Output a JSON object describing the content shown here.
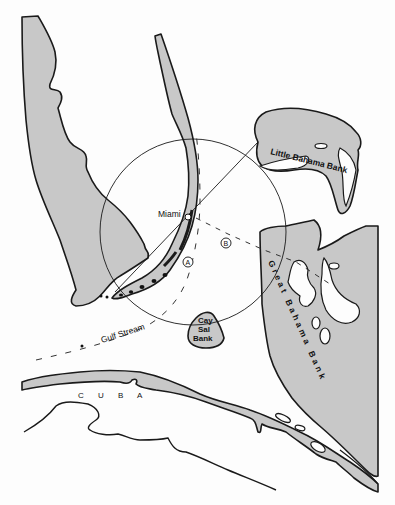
{
  "map": {
    "title": "",
    "colors": {
      "land": "#c8c8c8",
      "outline": "#1a1a1a",
      "background": "#fdfdfd"
    },
    "labels": {
      "miami": "Miami",
      "little_bahama_bank": "Little Bahama Bank",
      "great_bahama_bank": "Great Bahama Bank",
      "cay_sal_line1": "Cay",
      "cay_sal_line2": "Sal",
      "cay_sal_line3": "Bank",
      "gulf_stream": "Gulf Stream",
      "cuba": "C U B A",
      "point_a": "A",
      "point_b": "B"
    },
    "features": [
      "Florida peninsula",
      "Florida Keys reef tract",
      "Little Bahama Bank",
      "Great Bahama Bank",
      "Cay Sal Bank",
      "Cuba",
      "Gulf Stream path",
      "Circle centered near Florida Straits"
    ]
  }
}
